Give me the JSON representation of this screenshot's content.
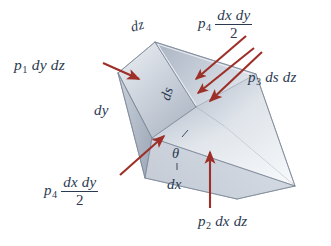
{
  "figure": {
    "type": "physics-free-body-diagram",
    "background_color": "#ffffff",
    "text_color": "#2b3a52",
    "arrow_color": "#9d2f28",
    "prism_fill_light": "#f2f4f7",
    "prism_fill_mid": "#c7ced9",
    "prism_fill_dark": "#9fa9b8",
    "prism_edge_color": "#8d97a6"
  },
  "labels": {
    "p1": {
      "p": "p",
      "sub": "1",
      "expr": "dy dz",
      "full": "p1 dy dz"
    },
    "p2": {
      "p": "p",
      "sub": "2",
      "expr": "dx dz",
      "full": "p2 dx dz"
    },
    "p3": {
      "p": "p",
      "sub": "3",
      "expr": "ds dz",
      "full": "p3 ds dz"
    },
    "p4_top": {
      "p": "p",
      "sub": "4",
      "numerator": "dx dy",
      "denominator": "2",
      "full": "p4 dx dy / 2"
    },
    "p4_bottom": {
      "p": "p",
      "sub": "4",
      "numerator": "dx dy",
      "denominator": "2",
      "full": "p4 dx dy / 2"
    }
  },
  "dimensions": {
    "dz": "dz",
    "dy": "dy",
    "ds": "ds",
    "dx": "dx",
    "theta": "θ"
  },
  "arrows": [
    {
      "name": "arrow-p1",
      "points_to": "left-vertical-face",
      "direction": "rightward"
    },
    {
      "name": "arrow-p2",
      "points_to": "bottom-face",
      "direction": "upward"
    },
    {
      "name": "arrow-p3",
      "points_to": "inclined-face",
      "direction": "down-left"
    },
    {
      "name": "arrow-p4-top",
      "points_to": "top-triangular-end",
      "direction": "down-left"
    },
    {
      "name": "arrow-p4-bottom",
      "points_to": "near-triangular-end",
      "direction": "up-right"
    }
  ]
}
